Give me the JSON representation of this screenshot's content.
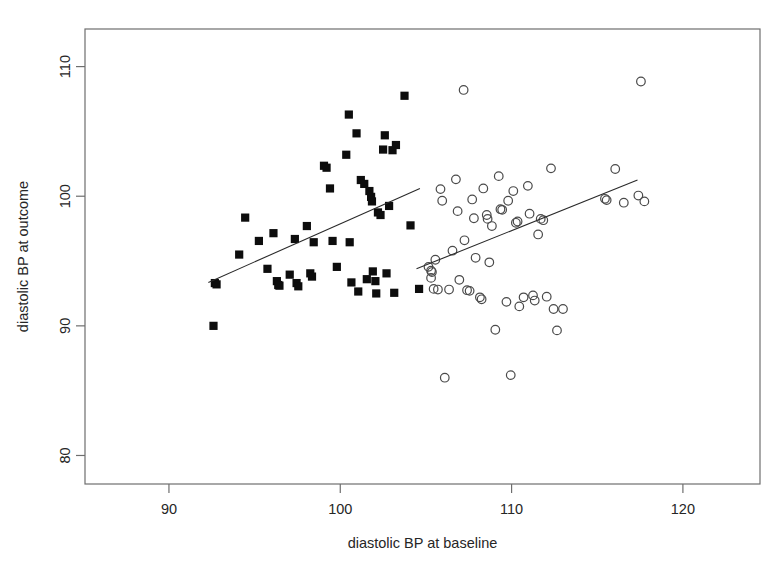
{
  "chart_data": {
    "type": "scatter",
    "title": "",
    "xlabel": "diastolic BP at baseline",
    "ylabel": "diastolic BP at outcome",
    "xlim": [
      85.1,
      124.5
    ],
    "ylim": [
      77.8,
      112.9
    ],
    "xticks": [
      90,
      100,
      110,
      120
    ],
    "yticks": [
      80,
      90,
      100,
      110
    ],
    "xtick_labels": [
      "90",
      "100",
      "110",
      "120"
    ],
    "ytick_labels": [
      "80",
      "90",
      "100",
      "110"
    ],
    "grid": false,
    "legend": "none",
    "box": true,
    "series": [
      {
        "name": "filled-square-group",
        "marker": "filled-square",
        "color": "#0d0d0d",
        "points": [
          [
            92.6,
            90.0
          ],
          [
            92.68,
            93.3
          ],
          [
            92.78,
            93.2
          ],
          [
            94.45,
            98.35
          ],
          [
            94.1,
            95.5
          ],
          [
            95.25,
            96.55
          ],
          [
            95.75,
            94.4
          ],
          [
            96.1,
            97.15
          ],
          [
            96.3,
            93.45
          ],
          [
            96.38,
            93.15
          ],
          [
            96.45,
            93.1
          ],
          [
            97.05,
            93.95
          ],
          [
            97.45,
            93.3
          ],
          [
            97.55,
            93.05
          ],
          [
            97.35,
            96.7
          ],
          [
            98.05,
            97.7
          ],
          [
            98.25,
            94.05
          ],
          [
            98.35,
            93.8
          ],
          [
            98.45,
            96.45
          ],
          [
            99.05,
            102.35
          ],
          [
            99.2,
            102.2
          ],
          [
            99.4,
            100.6
          ],
          [
            99.55,
            96.55
          ],
          [
            99.8,
            94.55
          ],
          [
            100.35,
            103.2
          ],
          [
            100.5,
            106.3
          ],
          [
            100.55,
            96.45
          ],
          [
            100.65,
            93.35
          ],
          [
            100.95,
            104.85
          ],
          [
            101.05,
            92.65
          ],
          [
            101.2,
            101.25
          ],
          [
            101.4,
            100.95
          ],
          [
            101.55,
            93.6
          ],
          [
            101.7,
            100.4
          ],
          [
            101.8,
            99.95
          ],
          [
            101.85,
            99.6
          ],
          [
            101.9,
            94.2
          ],
          [
            102.05,
            93.45
          ],
          [
            102.1,
            92.5
          ],
          [
            102.2,
            98.75
          ],
          [
            102.35,
            98.55
          ],
          [
            102.5,
            103.6
          ],
          [
            102.6,
            104.7
          ],
          [
            102.7,
            94.05
          ],
          [
            102.85,
            99.25
          ],
          [
            103.05,
            103.55
          ],
          [
            103.15,
            92.55
          ],
          [
            103.25,
            103.95
          ],
          [
            103.75,
            107.75
          ],
          [
            104.1,
            97.75
          ],
          [
            104.6,
            92.85
          ]
        ]
      },
      {
        "name": "open-circle-group",
        "marker": "open-circle",
        "color": "#4a4a4a",
        "points": [
          [
            105.15,
            94.55
          ],
          [
            105.3,
            94.25
          ],
          [
            105.35,
            94.15
          ],
          [
            105.3,
            93.7
          ],
          [
            105.55,
            95.1
          ],
          [
            105.45,
            92.85
          ],
          [
            105.7,
            92.8
          ],
          [
            105.85,
            100.55
          ],
          [
            105.95,
            99.65
          ],
          [
            106.1,
            86.0
          ],
          [
            106.35,
            92.8
          ],
          [
            106.55,
            95.8
          ],
          [
            106.75,
            101.3
          ],
          [
            106.85,
            98.85
          ],
          [
            106.95,
            93.55
          ],
          [
            107.2,
            108.2
          ],
          [
            107.25,
            96.6
          ],
          [
            107.4,
            92.75
          ],
          [
            107.55,
            92.7
          ],
          [
            107.7,
            99.75
          ],
          [
            107.8,
            98.3
          ],
          [
            107.9,
            95.25
          ],
          [
            108.15,
            92.2
          ],
          [
            108.25,
            92.05
          ],
          [
            108.35,
            100.6
          ],
          [
            108.55,
            98.55
          ],
          [
            108.6,
            98.25
          ],
          [
            108.7,
            94.9
          ],
          [
            108.85,
            97.7
          ],
          [
            109.05,
            89.7
          ],
          [
            109.25,
            101.55
          ],
          [
            109.35,
            99.0
          ],
          [
            109.45,
            98.95
          ],
          [
            109.7,
            91.85
          ],
          [
            109.8,
            99.65
          ],
          [
            109.95,
            86.2
          ],
          [
            110.1,
            100.4
          ],
          [
            110.25,
            97.95
          ],
          [
            110.35,
            98.05
          ],
          [
            110.45,
            91.5
          ],
          [
            110.7,
            92.2
          ],
          [
            110.95,
            100.8
          ],
          [
            111.05,
            98.65
          ],
          [
            111.25,
            92.35
          ],
          [
            111.35,
            91.95
          ],
          [
            111.55,
            97.05
          ],
          [
            111.7,
            98.25
          ],
          [
            111.85,
            98.15
          ],
          [
            112.05,
            92.25
          ],
          [
            112.3,
            102.15
          ],
          [
            112.45,
            91.3
          ],
          [
            112.65,
            89.65
          ],
          [
            113.0,
            91.3
          ],
          [
            115.45,
            99.8
          ],
          [
            115.55,
            99.7
          ],
          [
            116.05,
            102.1
          ],
          [
            116.55,
            99.5
          ],
          [
            117.4,
            100.05
          ],
          [
            117.55,
            108.85
          ],
          [
            117.75,
            99.6
          ]
        ]
      }
    ],
    "fit_lines": [
      {
        "name": "square-group-fit",
        "x0": 92.3,
        "y0": 93.35,
        "x1": 104.65,
        "y1": 100.6
      },
      {
        "name": "circle-group-fit",
        "x0": 104.45,
        "y0": 94.4,
        "x1": 117.35,
        "y1": 101.25
      }
    ]
  }
}
